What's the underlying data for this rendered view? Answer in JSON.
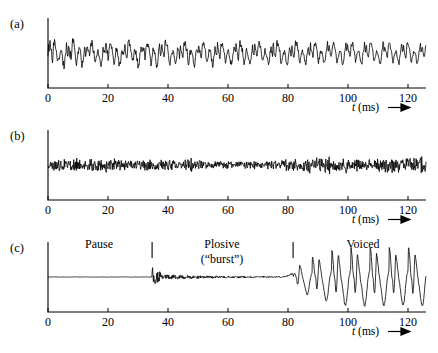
{
  "figure": {
    "background": "#ffffff",
    "ink": "#000000",
    "axis_label": "t (ms)",
    "axis_label_italic_part": "t",
    "axis_label_unit_part": " (ms)",
    "arrow_glyph": "right-arrow"
  },
  "panels": [
    {
      "id": "a",
      "label": "(a)",
      "origin_x": 48,
      "axis_y": 88,
      "axis_top_y": 18,
      "px_per_ms": 3.0,
      "xlim": [
        0,
        126
      ],
      "ticks": [
        0,
        20,
        40,
        60,
        80,
        100,
        120
      ],
      "tick_labels": [
        "0",
        "20",
        "40",
        "60",
        "80",
        "100",
        "120"
      ],
      "axis_title_x": 352,
      "axis_title_y": 111,
      "annotations": []
    },
    {
      "id": "b",
      "label": "(b)",
      "origin_x": 48,
      "axis_y": 200,
      "axis_top_y": 130,
      "px_per_ms": 3.0,
      "xlim": [
        0,
        126
      ],
      "ticks": [
        0,
        20,
        40,
        60,
        80,
        100,
        120
      ],
      "tick_labels": [
        "0",
        "20",
        "40",
        "60",
        "80",
        "100",
        "120"
      ],
      "axis_title_x": 352,
      "axis_title_y": 223,
      "annotations": []
    },
    {
      "id": "c",
      "label": "(c)",
      "origin_x": 48,
      "axis_y": 312,
      "axis_top_y": 242,
      "px_per_ms": 3.0,
      "xlim": [
        0,
        126
      ],
      "ticks": [
        0,
        20,
        40,
        60,
        80,
        100,
        120
      ],
      "tick_labels": [
        "0",
        "20",
        "40",
        "60",
        "80",
        "100",
        "120"
      ],
      "axis_title_x": 352,
      "axis_title_y": 335,
      "annotations": [
        {
          "name": "pause",
          "text": "Pause",
          "text2": "",
          "x_ms": 34.7,
          "label_x_ms": 17,
          "label_y": 248,
          "divider": false
        },
        {
          "name": "plosive",
          "text": "Plosive",
          "text2": "(“burst”)",
          "x_ms": 81.7,
          "label_x_ms": 58,
          "label_y": 248,
          "divider": true
        },
        {
          "name": "voiced",
          "text": "Voiced",
          "text2": "",
          "x_ms": 0,
          "label_x_ms": 105,
          "label_y": 248,
          "divider": false
        }
      ],
      "dividers_ms": [
        34.7,
        81.7
      ]
    }
  ],
  "chart_data": {
    "type": "line",
    "title": "",
    "xlabel": "t (ms)",
    "ylabel": "",
    "xlim": [
      0,
      126
    ],
    "grid": false,
    "legend": "none",
    "subplots": [
      {
        "name": "(a)",
        "description": "Voiced speech waveform: dense quasi-periodic oscillation with large negative spikes, amplitude decaying slightly and becoming smoother toward the right.",
        "x_unit": "ms",
        "baseline_y": 53,
        "amplitude_px": 18,
        "seed": 101,
        "style": "broadband-voiced"
      },
      {
        "name": "(b)",
        "description": "Unvoiced fricative / noise waveform: uniform dense random noise of nearly constant small amplitude across the whole record.",
        "x_unit": "ms",
        "baseline_y": 165,
        "amplitude_px": 10,
        "seed": 202,
        "style": "noise"
      },
      {
        "name": "(c)",
        "description": "Plosive consonant waveform: flat silent pause to ~35 ms, low-level burst noise from ~35 to ~82 ms, then large periodic voiced pulses from ~82 ms onward.",
        "x_unit": "ms",
        "baseline_y": 277,
        "amplitude_px": 34,
        "seed": 303,
        "style": "plosive",
        "regions": [
          {
            "label": "Pause",
            "start_ms": 0,
            "end_ms": 34.7
          },
          {
            "label": "Plosive (“burst”)",
            "start_ms": 34.7,
            "end_ms": 81.7
          },
          {
            "label": "Voiced",
            "start_ms": 81.7,
            "end_ms": 126
          }
        ],
        "voiced_pitch_period_ms": 6.4
      }
    ]
  }
}
